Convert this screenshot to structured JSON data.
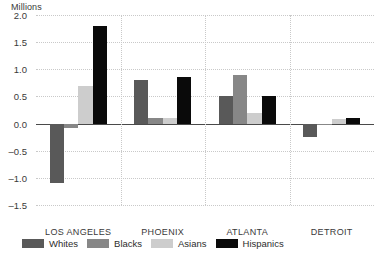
{
  "chart_data": {
    "type": "bar",
    "title": "",
    "subtitle": "",
    "ylabel": "Millions",
    "xlabel": "",
    "categories": [
      "LOS ANGELES",
      "PHOENIX",
      "ATLANTA",
      "DETROIT"
    ],
    "series": [
      {
        "name": "Whites",
        "color": "#595959",
        "values": [
          -1.1,
          0.8,
          0.5,
          -0.25
        ]
      },
      {
        "name": "Blacks",
        "color": "#878787",
        "values": [
          -0.08,
          0.1,
          0.9,
          0.0
        ]
      },
      {
        "name": "Asians",
        "color": "#cdcdcd",
        "values": [
          0.7,
          0.1,
          0.2,
          0.08
        ]
      },
      {
        "name": "Hispanics",
        "color": "#0a0a0a",
        "values": [
          1.8,
          0.85,
          0.5,
          0.1
        ]
      }
    ],
    "ylim": [
      -1.5,
      2.0
    ],
    "yticks": [
      2.0,
      1.5,
      1.0,
      0.5,
      0.0,
      -0.5,
      -1.0,
      -1.5
    ],
    "ytick_labels": [
      "2.0",
      "1.5",
      "1.0",
      "0.5",
      "0.0",
      "–0.5",
      "–1.0",
      "–1.5"
    ],
    "grid": true,
    "grid_style": "dotted",
    "zero_line": true,
    "legend_position": "bottom-left",
    "background": "#ffffff",
    "grid_color": "#c9c9c9",
    "axis_color": "#4a4a4a",
    "text_color": "#3a3a3a"
  }
}
